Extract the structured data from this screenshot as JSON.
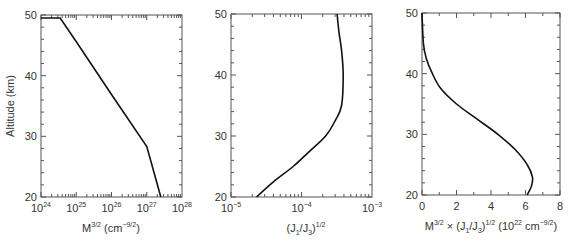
{
  "chart_data": [
    {
      "type": "line",
      "panel": 1,
      "title": "",
      "xlabel": "M^{3/2} (cm^{-9/2})",
      "xlabel_parts": {
        "base": "M",
        "sup1": "3/2",
        "mid": " (cm",
        "sup2": "−9/2",
        "end": ")"
      },
      "ylabel": "Altitude (km)",
      "xscale": "log",
      "xlim": [
        1e+24,
        1e+28
      ],
      "ylim": [
        20,
        50
      ],
      "xticks": [
        {
          "exp": "24"
        },
        {
          "exp": "25"
        },
        {
          "exp": "26"
        },
        {
          "exp": "27"
        },
        {
          "exp": "28"
        }
      ],
      "yticks": [
        "20",
        "30",
        "40",
        "50"
      ],
      "series": [
        {
          "name": "M^{3/2}",
          "x": [
            1e+24,
            3.5e+24,
            1e+25,
            1e+26,
            1e+27,
            2.5e+27
          ],
          "y": [
            49.5,
            49.5,
            45.6,
            36.9,
            28.3,
            20.0
          ]
        }
      ]
    },
    {
      "type": "line",
      "panel": 2,
      "title": "",
      "xlabel": "(J_1/J_3)^{1/2}",
      "ylabel": "",
      "xscale": "log",
      "xlim": [
        1e-05,
        0.001
      ],
      "ylim": [
        20,
        50
      ],
      "xticks": [
        {
          "exp": "−5"
        },
        {
          "exp": "−4"
        },
        {
          "exp": "−3"
        }
      ],
      "yticks": [
        "20",
        "30",
        "40",
        "50"
      ],
      "series": [
        {
          "name": "(J1/J3)^{1/2}",
          "x": [
            2.3e-05,
            4e-05,
            7.6e-05,
            0.00013,
            0.00022,
            0.0003,
            0.00037,
            0.00039,
            0.00037,
            0.00034,
            0.00032
          ],
          "y": [
            20,
            22.5,
            25,
            27.5,
            30,
            32.5,
            35,
            40,
            44,
            47,
            50
          ]
        }
      ]
    },
    {
      "type": "line",
      "panel": 3,
      "title": "",
      "xlabel": "M^{3/2} × (J_1/J_3)^{1/2} (10^{22} cm^{-9/2})",
      "ylabel": "",
      "xscale": "linear",
      "xlim": [
        0,
        8
      ],
      "ylim": [
        20,
        50
      ],
      "xticks": [
        "0",
        "2",
        "4",
        "6",
        "8"
      ],
      "yticks": [
        "20",
        "30",
        "40",
        "50"
      ],
      "series": [
        {
          "name": "product",
          "x": [
            6.1,
            6.35,
            6.4,
            6.1,
            5.4,
            4.4,
            3.2,
            2.0,
            1.1,
            0.6,
            0.25,
            0.08,
            0.0
          ],
          "y": [
            20,
            21.5,
            23,
            25,
            27.5,
            30,
            32.5,
            35,
            37.5,
            40,
            42.5,
            45,
            50
          ]
        }
      ]
    }
  ],
  "labels": {
    "ylabel": "Altitude (km)",
    "p1_x": {
      "a": "M",
      "b": "3/2",
      "c": " (cm",
      "d": "−9/2",
      "e": ")"
    },
    "p2_x": {
      "a": "(J",
      "b": "1",
      "c": "/J",
      "d": "3",
      "e": ")",
      "f": "1/2"
    },
    "p3_x": {
      "a": "M",
      "b": "3/2",
      "c": " × (J",
      "d": "1",
      "e": "/J",
      "f": "3",
      "g": ")",
      "h": "1/2",
      "i": " (10",
      "j": "22",
      "k": " cm",
      "l": "−9/2",
      "m": ")"
    },
    "base10": "10"
  }
}
